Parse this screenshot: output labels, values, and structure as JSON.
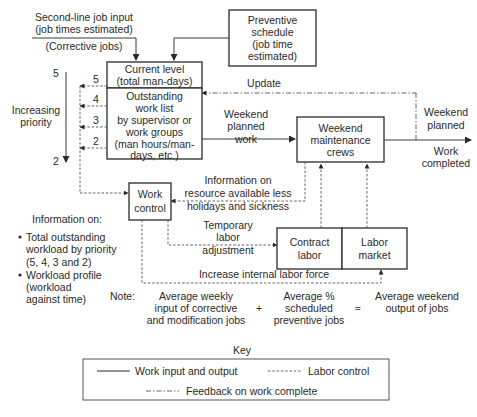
{
  "inputs": {
    "second_line": [
      "Second-line job input",
      "(job times estimated)"
    ],
    "corrective": "(Corrective jobs)"
  },
  "boxes": {
    "preventive_schedule": [
      "Preventive",
      "schedule",
      "(job time",
      "estimated)"
    ],
    "current_level": [
      "Current level",
      "(total man-days)"
    ],
    "outstanding_work_list": [
      "Outstanding",
      "work list",
      "by supervisor or",
      "work groups",
      "(man hours/man-",
      "days, etc.)"
    ],
    "weekend_crews": [
      "Weekend",
      "maintenance",
      "crews"
    ],
    "work_control": [
      "Work",
      "control"
    ],
    "contract_labor": [
      "Contract",
      "labor"
    ],
    "labor_market": [
      "Labor",
      "market"
    ]
  },
  "priority": {
    "label": [
      "Increasing",
      "priority"
    ],
    "top": "5",
    "bottom": "2",
    "levels": [
      "5",
      "4",
      "3",
      "2"
    ]
  },
  "flow_labels": {
    "update": "Update",
    "weekend_planned_work": [
      "Weekend",
      "planned",
      "work"
    ],
    "weekend_planned": [
      "Weekend",
      "planned"
    ],
    "work_completed": [
      "Work",
      "completed"
    ],
    "resource_info": [
      "Information on",
      "resource available less",
      "holidays and sickness"
    ],
    "temporary_labor": [
      "Temporary",
      "labor",
      "adjustment"
    ],
    "increase_internal": "Increase internal labor force"
  },
  "information": {
    "heading": "Information on:",
    "bullets": [
      [
        "Total outstanding",
        "workload by priority",
        "(5, 4, 3 and 2)"
      ],
      [
        "Workload profile",
        "(workload",
        "against time)"
      ]
    ]
  },
  "note": {
    "label": "Note:",
    "term1": [
      "Average weekly",
      "input of corrective",
      "and modification jobs"
    ],
    "plus": "+",
    "term2": [
      "Average %",
      "scheduled",
      "preventive jobs"
    ],
    "approx": "≈",
    "result": [
      "Average weekend",
      "output of jobs"
    ]
  },
  "key": {
    "title": "Key",
    "items": [
      {
        "style": "solid",
        "label": "Work input and output"
      },
      {
        "style": "dashed",
        "label": "Labor control"
      },
      {
        "style": "dash-dot",
        "label": "Feedback on work complete"
      }
    ]
  }
}
